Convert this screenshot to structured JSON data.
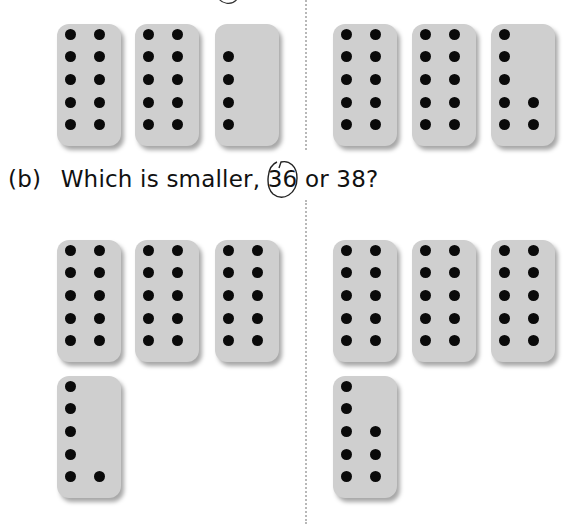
{
  "question": {
    "label": "(b)",
    "text_before": "Which is smaller,",
    "number_a": "36",
    "text_middle": "or",
    "number_b": "38?",
    "circled_answer": "36"
  },
  "groups": {
    "top_left": {
      "total": 24,
      "cards": [
        10,
        10,
        4
      ]
    },
    "top_right": {
      "total": 27,
      "cards": [
        10,
        10,
        7
      ]
    },
    "bottom_left": {
      "total": 36,
      "cards": [
        10,
        10,
        10,
        6
      ]
    },
    "bottom_right": {
      "total": 38,
      "cards": [
        10,
        10,
        10,
        8
      ]
    }
  },
  "colors": {
    "card": "#cfcfcf",
    "dot": "#0a0a0a",
    "ink": "#111111"
  }
}
